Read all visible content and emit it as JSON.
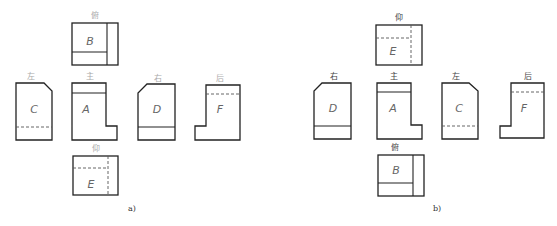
{
  "figure": {
    "a": {
      "caption": "a)",
      "views": {
        "top": {
          "label": "俯",
          "letter": "B"
        },
        "left": {
          "label": "左",
          "letter": "C"
        },
        "front": {
          "label": "主",
          "letter": "A"
        },
        "right": {
          "label": "右",
          "letter": "D"
        },
        "rear": {
          "label": "后",
          "letter": "F"
        },
        "bottom": {
          "label": "仰",
          "letter": "E"
        }
      }
    },
    "b": {
      "caption": "b)",
      "views": {
        "bottom": {
          "label": "仰",
          "letter": "E"
        },
        "right": {
          "label": "右",
          "letter": "D"
        },
        "front": {
          "label": "主",
          "letter": "A"
        },
        "left": {
          "label": "左",
          "letter": "C"
        },
        "rear": {
          "label": "后",
          "letter": "F"
        },
        "top": {
          "label": "俯",
          "letter": "B"
        }
      }
    }
  }
}
